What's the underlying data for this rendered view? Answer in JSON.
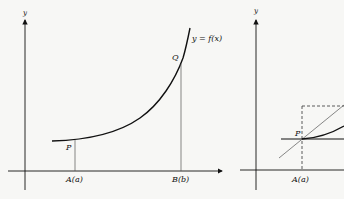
{
  "figure_left": {
    "y_axis_label": "y",
    "curve_label": "y = f(x)",
    "point_P_label": "P",
    "point_Q_label": "Q",
    "tick_A_label": "A(a)",
    "tick_B_label": "B(b)"
  },
  "figure_right": {
    "y_axis_label": "y",
    "point_P_label": "P",
    "tick_A_label": "A(a)"
  },
  "colors": {
    "background": "#f7f7f5",
    "curve": "#111111",
    "axes": "#111111",
    "thin_lines": "#555555"
  }
}
